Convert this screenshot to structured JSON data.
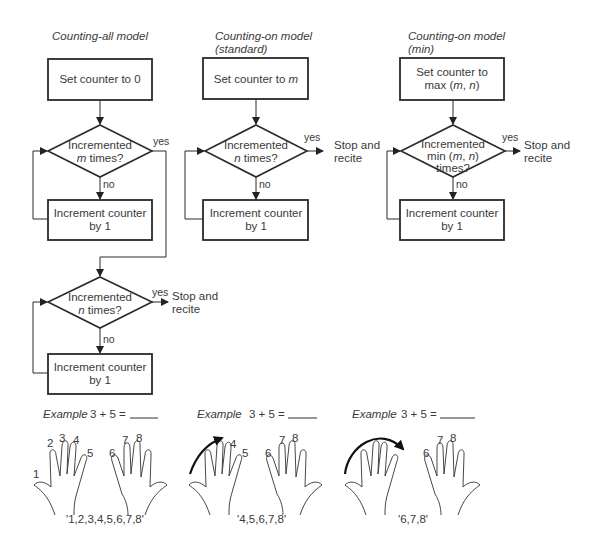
{
  "columns": [
    {
      "title_lines": [
        "Counting-all model"
      ],
      "start_box": [
        "Set counter to 0"
      ],
      "decision1": [
        "Incremented",
        "m times?"
      ],
      "decision1_var": "m",
      "yes_label": "yes",
      "no_label": "no",
      "loop_box": [
        "Increment counter",
        "by 1"
      ],
      "decision2": [
        "Incremented",
        "n times?"
      ],
      "decision2_var": "n",
      "yes2_label": "yes",
      "no2_label": "no",
      "loop_box2": [
        "Increment counter",
        "by 1"
      ],
      "outcome": [
        "Stop and",
        "recite"
      ]
    },
    {
      "title_lines": [
        "Counting-on model",
        "(standard)"
      ],
      "start_box": [
        "Set counter to m"
      ],
      "decision1": [
        "Incremented",
        "n times?"
      ],
      "yes_label": "yes",
      "no_label": "no",
      "loop_box": [
        "Increment counter",
        "by 1"
      ],
      "outcome": [
        "Stop and",
        "recite"
      ]
    },
    {
      "title_lines": [
        "Counting-on model",
        "(min)"
      ],
      "start_box": [
        "Set counter to",
        "max (m, n)"
      ],
      "decision1": [
        "Incremented",
        "min (m, n)",
        "times?"
      ],
      "yes_label": "yes",
      "no_label": "no",
      "loop_box": [
        "Increment counter",
        "by 1"
      ],
      "outcome": [
        "Stop and",
        "recite"
      ]
    }
  ],
  "examples": [
    {
      "label": "Example",
      "equation": "3 + 5 =",
      "finger_numbers": [
        "1",
        "2",
        "3",
        "4",
        "5",
        "6",
        "7",
        "8"
      ],
      "recital": "'1,2,3,4,5,6,7,8'"
    },
    {
      "label": "Example",
      "equation": "3 + 5 =",
      "finger_numbers": [
        "4",
        "5",
        "6",
        "7",
        "8"
      ],
      "recital": "'4,5,6,7,8'"
    },
    {
      "label": "Example",
      "equation": "3 + 5 =",
      "finger_numbers": [
        "6",
        "7",
        "8"
      ],
      "recital": "'6,7,8'"
    }
  ]
}
